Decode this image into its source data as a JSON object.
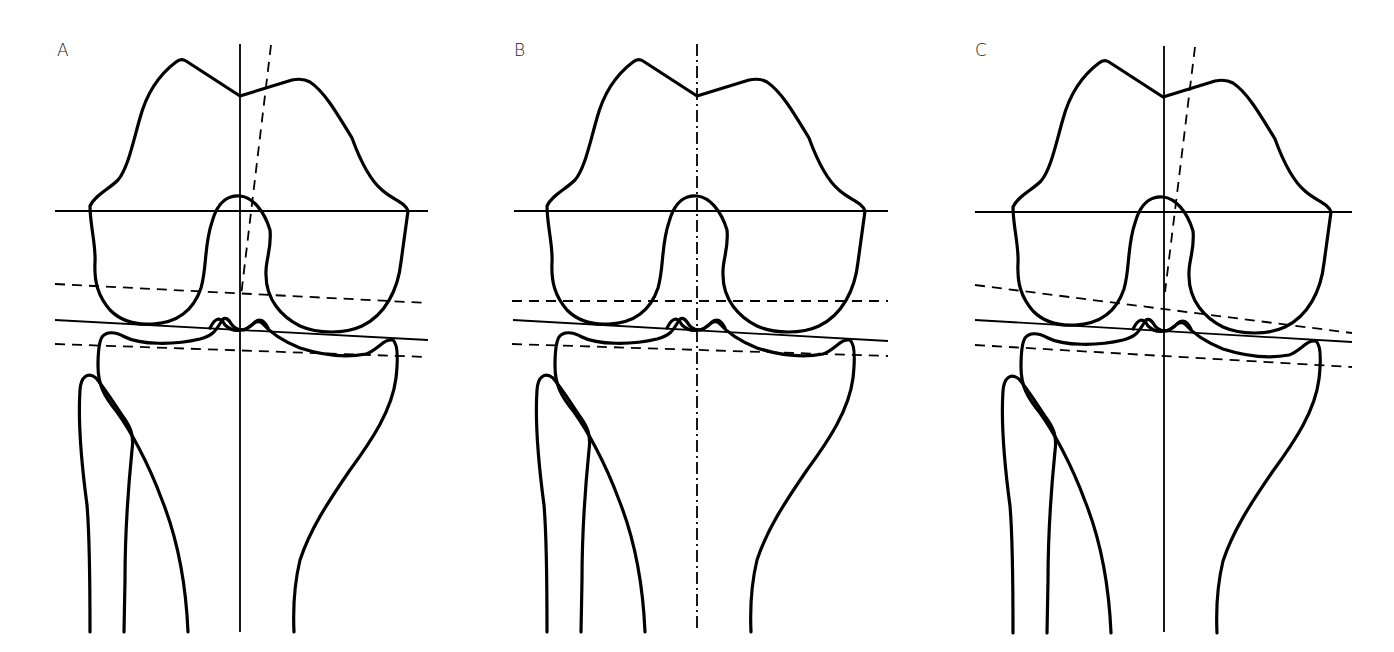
{
  "figure": {
    "stroke_color": "#000000",
    "background": "#ffffff"
  },
  "panels": [
    {
      "label": "A",
      "offset_x": 0,
      "label_pos": [
        57,
        56
      ],
      "vertical_axis": {
        "style": "solid",
        "x1": 240,
        "y1": 44,
        "x2": 240,
        "y2": 632
      },
      "anatomical_axis": {
        "style": "dashed",
        "x1": 271,
        "y1": 45,
        "x2": 241,
        "y2": 296
      },
      "femoral_horizontal": {
        "style": "solid",
        "x1": 55,
        "y1": 211,
        "x2": 428,
        "y2": 211
      },
      "upper_dashed": {
        "style": "dashed",
        "x1": 55,
        "y1": 284,
        "x2": 428,
        "y2": 303
      },
      "joint_line": {
        "style": "solid",
        "x1": 55,
        "y1": 320,
        "x2": 428,
        "y2": 340
      },
      "lower_dashed": {
        "style": "dashed",
        "x1": 55,
        "y1": 344,
        "x2": 428,
        "y2": 357
      }
    },
    {
      "label": "B",
      "offset_x": 457,
      "label_pos": [
        514,
        56
      ],
      "vertical_axis": {
        "style": "dashdot",
        "x1": 697,
        "y1": 44,
        "x2": 697,
        "y2": 632
      },
      "anatomical_axis": null,
      "femoral_horizontal": {
        "style": "solid",
        "x1": 514,
        "y1": 211,
        "x2": 888,
        "y2": 211
      },
      "upper_dashed": {
        "style": "dashed",
        "x1": 512,
        "y1": 301,
        "x2": 888,
        "y2": 301
      },
      "joint_line": {
        "style": "solid",
        "x1": 513,
        "y1": 320,
        "x2": 888,
        "y2": 341
      },
      "lower_dashed": {
        "style": "dashed",
        "x1": 512,
        "y1": 344,
        "x2": 888,
        "y2": 356
      }
    },
    {
      "label": "C",
      "offset_x": 923,
      "label_pos": [
        975,
        56
      ],
      "vertical_axis": {
        "style": "solid",
        "x1": 1164,
        "y1": 46,
        "x2": 1164,
        "y2": 632
      },
      "anatomical_axis": {
        "style": "dashed",
        "x1": 1195,
        "y1": 47,
        "x2": 1165,
        "y2": 292
      },
      "femoral_horizontal": {
        "style": "solid",
        "x1": 975,
        "y1": 212,
        "x2": 1352,
        "y2": 212
      },
      "upper_dashed": {
        "style": "dashed",
        "x1": 975,
        "y1": 285,
        "x2": 1352,
        "y2": 333
      },
      "joint_line": {
        "style": "solid",
        "x1": 975,
        "y1": 320,
        "x2": 1352,
        "y2": 342
      },
      "lower_dashed": {
        "style": "dashed",
        "x1": 975,
        "y1": 345,
        "x2": 1352,
        "y2": 367
      }
    }
  ]
}
